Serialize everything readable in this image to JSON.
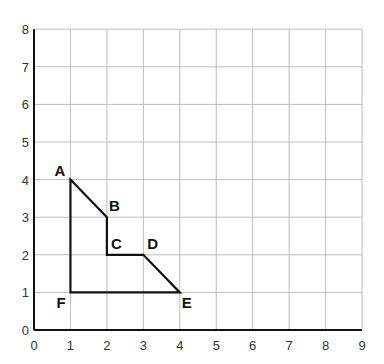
{
  "chart_data": {
    "type": "line",
    "title": "",
    "xlabel": "",
    "ylabel": "",
    "xlim": [
      0,
      9
    ],
    "ylim": [
      0,
      8
    ],
    "grid": true,
    "x_ticks": [
      "0",
      "1",
      "2",
      "3",
      "4",
      "5",
      "6",
      "7",
      "8",
      "9"
    ],
    "y_ticks": [
      "0",
      "1",
      "2",
      "3",
      "4",
      "5",
      "6",
      "7",
      "8"
    ],
    "series": [
      {
        "name": "polygon ABCDEF",
        "closed": true,
        "points": [
          {
            "label": "A",
            "x": 1,
            "y": 4
          },
          {
            "label": "B",
            "x": 2,
            "y": 3
          },
          {
            "label": "C",
            "x": 2,
            "y": 2
          },
          {
            "label": "D",
            "x": 3,
            "y": 2
          },
          {
            "label": "E",
            "x": 4,
            "y": 1
          },
          {
            "label": "F",
            "x": 1,
            "y": 1
          }
        ]
      }
    ],
    "colors": {
      "grid": "#bdbdbd",
      "axis": "#111111",
      "shape": "#111111"
    }
  }
}
